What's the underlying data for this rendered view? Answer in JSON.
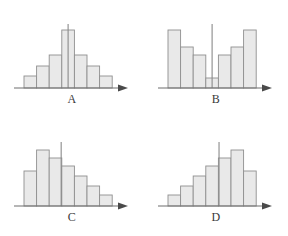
{
  "figure": {
    "panel_count": 4,
    "bar_fill_color": "#e9e9e9",
    "bar_stroke_color": "#8f8f8f",
    "axis_color": "#6e6e6e",
    "reference_line_color": "#8a8a8a",
    "background_color": "#ffffff"
  },
  "chart_data": [
    {
      "type": "bar",
      "title": "A",
      "shape": "symmetric bell-shaped distribution",
      "categories": [
        "1",
        "2",
        "3",
        "4",
        "5",
        "6",
        "7"
      ],
      "values": [
        12,
        22,
        33,
        58,
        33,
        22,
        12
      ],
      "xlabel": "",
      "ylabel": "",
      "ylim": [
        0,
        66
      ],
      "grid": false,
      "legend": "none",
      "annotations": [
        {
          "kind": "vertical-reference-line",
          "label": "center line",
          "x_category_index": 3,
          "x_fraction": 0.5,
          "height": 64
        },
        {
          "kind": "axis-arrow",
          "label": "x-axis arrow",
          "position": "right"
        }
      ]
    },
    {
      "type": "bar",
      "title": "B",
      "shape": "bimodal U-shaped distribution",
      "categories": [
        "1",
        "2",
        "3",
        "4",
        "5",
        "6",
        "7"
      ],
      "values": [
        58,
        41,
        33,
        10,
        33,
        41,
        58
      ],
      "xlabel": "",
      "ylabel": "",
      "ylim": [
        0,
        66
      ],
      "grid": false,
      "legend": "none",
      "annotations": [
        {
          "kind": "vertical-reference-line",
          "label": "center line",
          "x_category_index": 3,
          "x_fraction": 0.5,
          "height": 64
        },
        {
          "kind": "axis-arrow",
          "label": "x-axis arrow",
          "position": "right"
        }
      ]
    },
    {
      "type": "bar",
      "title": "C",
      "shape": "right-skewed distribution",
      "categories": [
        "1",
        "2",
        "3",
        "4",
        "5",
        "6",
        "7"
      ],
      "values": [
        35,
        56,
        48,
        40,
        30,
        20,
        11
      ],
      "xlabel": "",
      "ylabel": "",
      "ylim": [
        0,
        66
      ],
      "grid": false,
      "legend": "none",
      "annotations": [
        {
          "kind": "vertical-reference-line",
          "label": "center line",
          "x_category_index": 2,
          "x_fraction": 0.95,
          "height": 64
        },
        {
          "kind": "axis-arrow",
          "label": "x-axis arrow",
          "position": "right"
        }
      ]
    },
    {
      "type": "bar",
      "title": "D",
      "shape": "left-skewed distribution",
      "categories": [
        "1",
        "2",
        "3",
        "4",
        "5",
        "6",
        "7"
      ],
      "values": [
        11,
        20,
        30,
        40,
        48,
        56,
        35
      ],
      "xlabel": "",
      "ylabel": "",
      "ylim": [
        0,
        66
      ],
      "grid": false,
      "legend": "none",
      "annotations": [
        {
          "kind": "vertical-reference-line",
          "label": "center line",
          "x_category_index": 4,
          "x_fraction": 0.05,
          "height": 64
        },
        {
          "kind": "axis-arrow",
          "label": "x-axis arrow",
          "position": "right"
        }
      ]
    }
  ]
}
